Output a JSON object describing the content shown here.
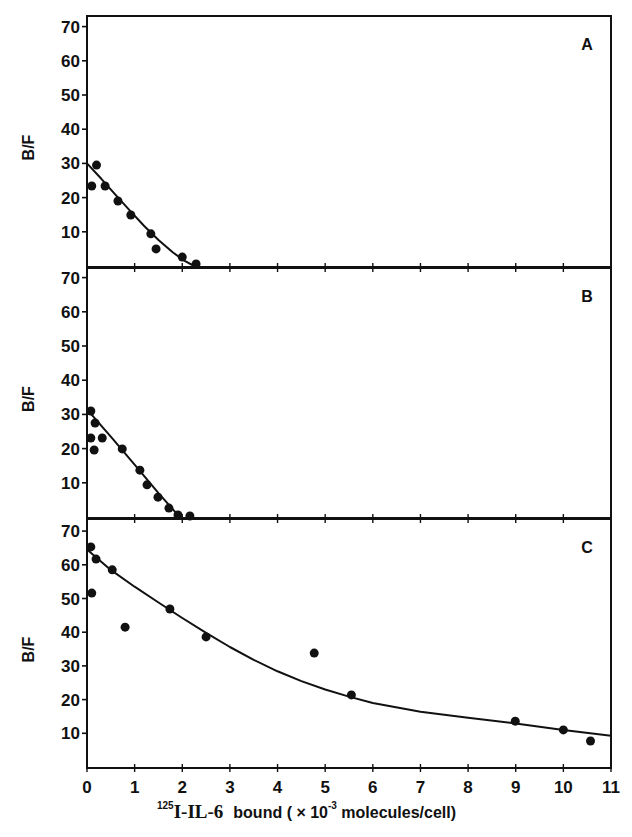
{
  "chart_data": {
    "type": "scatter",
    "layout": "three vertically stacked panels sharing x axis",
    "xlabel": {
      "superscript": "125",
      "isotope_part": "I-IL-6",
      "text": "bound ( × 10",
      "exponent": "-3",
      "unit": " molecules/cell)"
    },
    "xlim": [
      0,
      11
    ],
    "x_ticks": [
      0,
      1,
      2,
      3,
      4,
      5,
      6,
      7,
      8,
      9,
      10,
      11
    ],
    "grid": false,
    "panels": [
      {
        "label": "A",
        "ylabel": "B/F",
        "ylim": [
          0,
          72
        ],
        "y_ticks": [
          10,
          20,
          30,
          40,
          50,
          60,
          70
        ],
        "points": [
          {
            "x": 0.1,
            "y": 23.4
          },
          {
            "x": 0.2,
            "y": 29.5
          },
          {
            "x": 0.38,
            "y": 23.4
          },
          {
            "x": 0.65,
            "y": 19.0
          },
          {
            "x": 0.92,
            "y": 14.9
          },
          {
            "x": 1.34,
            "y": 9.4
          },
          {
            "x": 1.45,
            "y": 5.0
          },
          {
            "x": 2.0,
            "y": 2.6
          },
          {
            "x": 2.29,
            "y": 0.6
          }
        ],
        "fit_curve": [
          {
            "x": 0.0,
            "y": 30.0
          },
          {
            "x": 0.3,
            "y": 25.5
          },
          {
            "x": 0.6,
            "y": 20.8
          },
          {
            "x": 0.9,
            "y": 16.2
          },
          {
            "x": 1.2,
            "y": 11.7
          },
          {
            "x": 1.5,
            "y": 7.6
          },
          {
            "x": 1.8,
            "y": 4.0
          },
          {
            "x": 2.05,
            "y": 1.5
          },
          {
            "x": 2.25,
            "y": 0.0
          }
        ]
      },
      {
        "label": "B",
        "ylabel": "B/F",
        "ylim": [
          0,
          72
        ],
        "y_ticks": [
          10,
          20,
          30,
          40,
          50,
          60,
          70
        ],
        "points": [
          {
            "x": 0.08,
            "y": 31.0
          },
          {
            "x": 0.17,
            "y": 27.5
          },
          {
            "x": 0.08,
            "y": 23.1
          },
          {
            "x": 0.15,
            "y": 19.6
          },
          {
            "x": 0.32,
            "y": 23.1
          },
          {
            "x": 0.74,
            "y": 19.9
          },
          {
            "x": 1.11,
            "y": 13.7
          },
          {
            "x": 1.26,
            "y": 9.4
          },
          {
            "x": 1.49,
            "y": 5.8
          },
          {
            "x": 1.72,
            "y": 2.6
          },
          {
            "x": 1.91,
            "y": 0.6
          },
          {
            "x": 2.16,
            "y": 0.3
          }
        ],
        "fit_curve": [
          {
            "x": 0.0,
            "y": 31.5
          },
          {
            "x": 0.5,
            "y": 23.5
          },
          {
            "x": 1.0,
            "y": 15.3
          },
          {
            "x": 1.5,
            "y": 7.0
          },
          {
            "x": 1.85,
            "y": 1.5
          },
          {
            "x": 2.0,
            "y": 0.0
          }
        ]
      },
      {
        "label": "C",
        "ylabel": "B/F",
        "ylim": [
          0,
          72
        ],
        "y_ticks": [
          10,
          20,
          30,
          40,
          50,
          60,
          70
        ],
        "points": [
          {
            "x": 0.08,
            "y": 65.3
          },
          {
            "x": 0.19,
            "y": 61.7
          },
          {
            "x": 0.1,
            "y": 51.6
          },
          {
            "x": 0.53,
            "y": 58.5
          },
          {
            "x": 0.8,
            "y": 41.5
          },
          {
            "x": 1.74,
            "y": 46.9
          },
          {
            "x": 2.5,
            "y": 38.6
          },
          {
            "x": 4.77,
            "y": 33.8
          },
          {
            "x": 5.55,
            "y": 21.4
          },
          {
            "x": 8.99,
            "y": 13.6
          },
          {
            "x": 10.0,
            "y": 11.0
          },
          {
            "x": 10.57,
            "y": 7.7
          }
        ],
        "fit_curve": [
          {
            "x": 0.0,
            "y": 64.5
          },
          {
            "x": 0.5,
            "y": 58.5
          },
          {
            "x": 1.0,
            "y": 53.5
          },
          {
            "x": 1.5,
            "y": 48.8
          },
          {
            "x": 2.0,
            "y": 44.2
          },
          {
            "x": 2.5,
            "y": 39.8
          },
          {
            "x": 3.0,
            "y": 35.6
          },
          {
            "x": 3.5,
            "y": 31.8
          },
          {
            "x": 4.0,
            "y": 28.4
          },
          {
            "x": 4.5,
            "y": 25.5
          },
          {
            "x": 5.0,
            "y": 23.0
          },
          {
            "x": 5.5,
            "y": 20.9
          },
          {
            "x": 6.0,
            "y": 19.0
          },
          {
            "x": 7.0,
            "y": 16.4
          },
          {
            "x": 8.0,
            "y": 14.6
          },
          {
            "x": 9.0,
            "y": 12.9
          },
          {
            "x": 10.0,
            "y": 11.0
          },
          {
            "x": 11.0,
            "y": 9.3
          }
        ]
      }
    ]
  }
}
